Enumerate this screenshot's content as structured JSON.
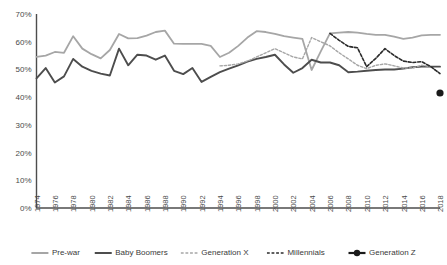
{
  "chart_data": {
    "type": "line",
    "title": "",
    "xlabel": "",
    "ylabel": "",
    "ylim": [
      0,
      70
    ],
    "ytick_values": [
      0,
      10,
      20,
      30,
      40,
      50,
      60,
      70
    ],
    "ytick_labels": [
      "0%",
      "10%",
      "20%",
      "30%",
      "40%",
      "50%",
      "60%",
      "70%"
    ],
    "xlim": [
      1974,
      2018
    ],
    "xtick_labels": [
      "1974",
      "1976",
      "1978",
      "1980",
      "1982",
      "1984",
      "1986",
      "1988",
      "1990",
      "1992",
      "1994",
      "1996",
      "1998",
      "2000",
      "2002",
      "2004",
      "2006",
      "2008",
      "2010",
      "2012",
      "2014",
      "2016",
      "2018"
    ],
    "grid": false,
    "legend_position": "bottom",
    "x": [
      1974,
      1975,
      1976,
      1977,
      1978,
      1979,
      1980,
      1981,
      1982,
      1983,
      1984,
      1985,
      1986,
      1987,
      1988,
      1989,
      1990,
      1991,
      1992,
      1993,
      1994,
      1995,
      1996,
      1997,
      1998,
      1999,
      2000,
      2001,
      2002,
      2003,
      2004,
      2005,
      2006,
      2007,
      2008,
      2009,
      2010,
      2011,
      2012,
      2013,
      2014,
      2015,
      2016,
      2017,
      2018
    ],
    "series": [
      {
        "name": "Pre-war",
        "color": "#a6a6a6",
        "style": "solid",
        "width": 1.8,
        "x": [
          1974,
          1975,
          1976,
          1977,
          1978,
          1979,
          1980,
          1981,
          1982,
          1983,
          1984,
          1985,
          1986,
          1987,
          1988,
          1989,
          1990,
          1991,
          1992,
          1993,
          1994,
          1995,
          1996,
          1997,
          1998,
          1999,
          2000,
          2001,
          2002,
          2003,
          2004,
          2005,
          2006,
          2007,
          2008,
          2009,
          2010,
          2011,
          2012,
          2013,
          2014,
          2015,
          2016,
          2017,
          2018
        ],
        "values": [
          54.5,
          55.0,
          56.3,
          56.0,
          62.0,
          57.5,
          55.5,
          54.0,
          57.0,
          62.8,
          61.2,
          61.3,
          62.2,
          63.5,
          64.0,
          59.3,
          59.2,
          59.2,
          59.2,
          58.5,
          54.5,
          56.0,
          58.5,
          61.5,
          63.8,
          63.5,
          62.8,
          62.0,
          61.5,
          61.0,
          49.8,
          56.5,
          63.0,
          63.3,
          63.5,
          63.3,
          62.8,
          62.5,
          62.5,
          61.8,
          61.0,
          61.5,
          62.3,
          62.5,
          62.5
        ]
      },
      {
        "name": "Baby Boomers",
        "color": "#4d4d4d",
        "style": "solid",
        "width": 1.9,
        "x": [
          1974,
          1975,
          1976,
          1977,
          1978,
          1979,
          1980,
          1981,
          1982,
          1983,
          1984,
          1985,
          1986,
          1987,
          1988,
          1989,
          1990,
          1991,
          1992,
          1993,
          1994,
          1995,
          1996,
          1997,
          1998,
          1999,
          2000,
          2001,
          2002,
          2003,
          2004,
          2005,
          2006,
          2007,
          2008,
          2009,
          2010,
          2011,
          2012,
          2013,
          2014,
          2015,
          2016,
          2017,
          2018
        ],
        "values": [
          46.8,
          50.5,
          45.3,
          47.5,
          53.8,
          51.0,
          49.5,
          48.5,
          47.8,
          57.5,
          51.5,
          55.3,
          55.0,
          53.5,
          55.0,
          49.5,
          48.3,
          50.5,
          45.5,
          47.3,
          49.0,
          50.3,
          51.5,
          52.8,
          53.8,
          54.5,
          55.3,
          51.8,
          48.8,
          50.5,
          53.5,
          52.5,
          52.5,
          51.5,
          49.0,
          49.2,
          49.5,
          49.8,
          50.0,
          50.0,
          50.3,
          50.8,
          51.0,
          51.0,
          51.0
        ]
      },
      {
        "name": "Generation X",
        "color": "#a6a6a6",
        "style": "dashed",
        "width": 1.4,
        "x": [
          1994,
          1995,
          1996,
          1997,
          1998,
          1999,
          2000,
          2001,
          2002,
          2003,
          2004,
          2005,
          2006,
          2007,
          2008,
          2009,
          2010,
          2011,
          2012,
          2013,
          2014,
          2015,
          2016,
          2017,
          2018
        ],
        "values": [
          51.3,
          51.5,
          52.0,
          53.0,
          54.5,
          56.0,
          57.5,
          56.0,
          54.5,
          53.8,
          61.5,
          60.0,
          58.5,
          56.0,
          53.8,
          51.5,
          50.3,
          51.5,
          52.0,
          51.3,
          50.5,
          50.5,
          51.5,
          51.0,
          48.5
        ]
      },
      {
        "name": "Millennials",
        "color": "#2b2b2b",
        "style": "dashed",
        "width": 1.6,
        "x": [
          2006,
          2007,
          2008,
          2009,
          2010,
          2011,
          2012,
          2013,
          2014,
          2015,
          2016,
          2017,
          2018
        ],
        "values": [
          63.0,
          60.5,
          58.3,
          57.8,
          51.0,
          54.0,
          57.5,
          55.0,
          53.0,
          52.5,
          52.8,
          51.0,
          48.5
        ]
      },
      {
        "name": "Generation Z",
        "color": "#1a1a1a",
        "style": "marker",
        "width": 2.0,
        "x": [
          2018
        ],
        "values": [
          41.5
        ]
      }
    ]
  },
  "legend": {
    "items": [
      {
        "label": "Pre-war",
        "color": "#a6a6a6",
        "style": "solid"
      },
      {
        "label": "Baby Boomers",
        "color": "#4d4d4d",
        "style": "solid"
      },
      {
        "label": "Generation X",
        "color": "#a6a6a6",
        "style": "dashed"
      },
      {
        "label": "Millennials",
        "color": "#2b2b2b",
        "style": "dashed"
      },
      {
        "label": "Generation Z",
        "color": "#1a1a1a",
        "style": "marker"
      }
    ]
  },
  "colors": {
    "axis": "#4d4d4d",
    "text": "#3a3a3a",
    "background": "#ffffff"
  }
}
